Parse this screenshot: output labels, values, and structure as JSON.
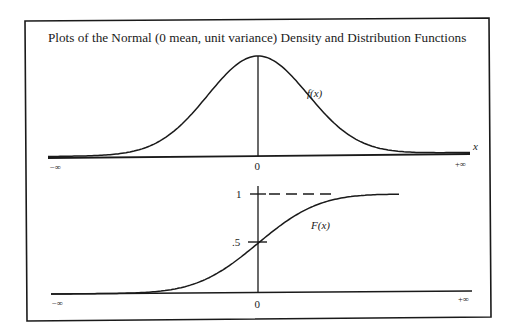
{
  "title": "Plots of the Normal (0 mean, unit variance) Density and Distribution Functions",
  "colors": {
    "ink": "#1a1a1a",
    "background": "#ffffff"
  },
  "density_plot": {
    "curve_label": "f(x)",
    "axis_label": "x",
    "x_ticks": {
      "left": "−∞",
      "center": "0",
      "right": "+∞"
    }
  },
  "distribution_plot": {
    "curve_label": "F(x)",
    "y_ticks": {
      "one": "1",
      "half": ".5"
    },
    "x_ticks": {
      "left": "−∞",
      "center": "0",
      "right": "+∞"
    }
  },
  "chart_data": [
    {
      "type": "line",
      "title": "Normal density f(x), mean 0, unit variance",
      "xlabel": "x",
      "ylabel": "f(x)",
      "x_tick_labels": [
        "−∞",
        "0",
        "+∞"
      ],
      "x": [
        -3,
        -2.5,
        -2,
        -1.5,
        -1,
        -0.5,
        0,
        0.5,
        1,
        1.5,
        2,
        2.5,
        3
      ],
      "values": [
        0.004,
        0.018,
        0.054,
        0.13,
        0.242,
        0.352,
        0.399,
        0.352,
        0.242,
        0.13,
        0.054,
        0.018,
        0.004
      ],
      "grid": false
    },
    {
      "type": "line",
      "title": "Normal distribution function F(x)",
      "xlabel": "x",
      "ylabel": "F(x)",
      "x_tick_labels": [
        "−∞",
        "0",
        "+∞"
      ],
      "y_tick_labels": [
        ".5",
        "1"
      ],
      "x": [
        -3,
        -2.5,
        -2,
        -1.5,
        -1,
        -0.5,
        0,
        0.5,
        1,
        1.5,
        2,
        2.5,
        3
      ],
      "values": [
        0.001,
        0.006,
        0.023,
        0.067,
        0.159,
        0.309,
        0.5,
        0.691,
        0.841,
        0.933,
        0.977,
        0.994,
        0.999
      ],
      "ylim": [
        0,
        1
      ],
      "annotations": [
        "dashed asymptote at F = 1"
      ],
      "grid": false
    }
  ]
}
